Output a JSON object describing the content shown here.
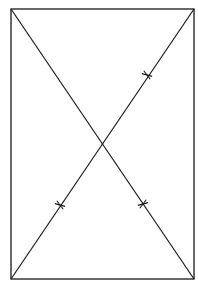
{
  "diagram": {
    "type": "rectangle-with-diagonals",
    "stroke_color": "#1a1a1a",
    "background": "#ffffff",
    "rectangle": {
      "x1": 11,
      "y1": 9,
      "x2": 194,
      "y2": 279
    },
    "vertices": {
      "top_left": [
        11,
        9
      ],
      "top_right": [
        194,
        9
      ],
      "bottom_left": [
        11,
        279
      ],
      "bottom_right": [
        194,
        279
      ]
    },
    "diagonals": [
      {
        "name": "main-diagonal",
        "from": [
          11,
          9
        ],
        "to": [
          194,
          279
        ]
      },
      {
        "name": "anti-diagonal",
        "from": [
          11,
          279
        ],
        "to": [
          194,
          9
        ]
      }
    ],
    "intersection": [
      101,
      144
    ],
    "tick_marks": [
      {
        "on": "anti-diagonal",
        "at": [
          147,
          75
        ]
      },
      {
        "on": "anti-diagonal",
        "at": [
          60,
          205
        ]
      },
      {
        "on": "main-diagonal",
        "at": [
          143,
          204
        ]
      }
    ]
  }
}
